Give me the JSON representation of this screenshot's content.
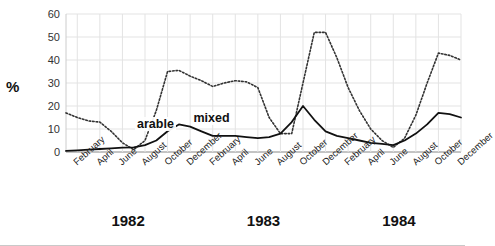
{
  "chart_data": {
    "type": "line",
    "title": "",
    "xlabel": "",
    "ylabel": "%",
    "ylim": [
      0,
      60
    ],
    "yticks": [
      0,
      10,
      20,
      30,
      40,
      50,
      60
    ],
    "grid": true,
    "legend_position": "inline-annotations",
    "years": [
      "1982",
      "1983",
      "1984"
    ],
    "month_labels": [
      "February",
      "April",
      "June",
      "August",
      "October",
      "December"
    ],
    "x": [
      "Jan 1982",
      "Feb 1982",
      "Mar 1982",
      "Apr 1982",
      "May 1982",
      "Jun 1982",
      "Jul 1982",
      "Aug 1982",
      "Sep 1982",
      "Oct 1982",
      "Nov 1982",
      "Dec 1982",
      "Jan 1983",
      "Feb 1983",
      "Mar 1983",
      "Apr 1983",
      "May 1983",
      "Jun 1983",
      "Jul 1983",
      "Aug 1983",
      "Sep 1983",
      "Oct 1983",
      "Nov 1983",
      "Dec 1983",
      "Jan 1984",
      "Feb 1984",
      "Mar 1984",
      "Apr 1984",
      "May 1984",
      "Jun 1984",
      "Jul 1984",
      "Aug 1984",
      "Sep 1984",
      "Oct 1984",
      "Nov 1984",
      "Dec 1984"
    ],
    "series": [
      {
        "name": "arable",
        "style": "dotted",
        "color": "#333333",
        "values": [
          17,
          15,
          13.5,
          13,
          9,
          4,
          1,
          5,
          18,
          35,
          35.5,
          33,
          31,
          28.5,
          30,
          31,
          30.5,
          28,
          15,
          8,
          8,
          30,
          52,
          52,
          41,
          28,
          18,
          10,
          5,
          2,
          6,
          16,
          30,
          43,
          42,
          40
        ]
      },
      {
        "name": "mixed",
        "style": "solid",
        "color": "#111111",
        "values": [
          0.5,
          0.7,
          1,
          1.3,
          1.6,
          1.9,
          2,
          3,
          5,
          9,
          12,
          11,
          9,
          7,
          7,
          7,
          6.5,
          6,
          6.5,
          8,
          13,
          20,
          14,
          9,
          7,
          6,
          5,
          4,
          3.5,
          3,
          5,
          8,
          12,
          17,
          16.5,
          15
        ]
      }
    ],
    "annotations": [
      {
        "text": "arable",
        "x": "Aug 1982"
      },
      {
        "text": "mixed",
        "x": "Jan 1983"
      }
    ]
  }
}
